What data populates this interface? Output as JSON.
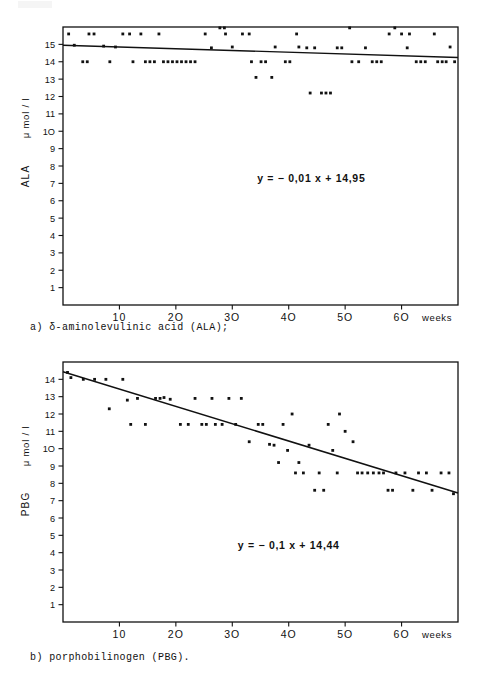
{
  "figure": {
    "kind": "two-panel-scatter-with-regression",
    "captions": {
      "a": "a) δ-aminolevulinic acid (ALA);",
      "b": "b) porphobilinogen (PBG)."
    }
  },
  "chart_data": [
    {
      "id": "panel-a",
      "type": "scatter",
      "title": "",
      "xlabel": "weeks",
      "ylabel": "ALA   μ mol / l",
      "ylabel_parts": {
        "analyte": "ALA",
        "unit": "μ mol / l"
      },
      "xlim": [
        0,
        70
      ],
      "ylim": [
        0,
        16
      ],
      "xticks": [
        10,
        20,
        30,
        40,
        50,
        60
      ],
      "xticklabels": [
        "10",
        "2O",
        "3O",
        "4O",
        "5O",
        "6O"
      ],
      "yticks": [
        1,
        2,
        3,
        4,
        5,
        6,
        7,
        8,
        9,
        10,
        11,
        12,
        13,
        14,
        15
      ],
      "yticklabels": [
        "1",
        "2",
        "3",
        "4",
        "5",
        "6",
        "7",
        "8",
        "9",
        "1O",
        "11",
        "12",
        "13",
        "14",
        "15"
      ],
      "grid": false,
      "frame": true,
      "annotation": "y = − 0,01 x + 14,95",
      "annotation_x": 44,
      "annotation_y": 7.1,
      "regression": {
        "slope": -0.01,
        "intercept": 14.95,
        "equation": "y = − 0,01 x + 14,95"
      },
      "points": [
        [
          1.0,
          15.6
        ],
        [
          2.0,
          14.95
        ],
        [
          3.5,
          14.0
        ],
        [
          4.3,
          14.0
        ],
        [
          4.6,
          15.6
        ],
        [
          5.5,
          15.6
        ],
        [
          7.2,
          14.9
        ],
        [
          8.3,
          14.0
        ],
        [
          9.3,
          14.85
        ],
        [
          10.6,
          15.6
        ],
        [
          11.8,
          15.6
        ],
        [
          12.4,
          14.0
        ],
        [
          13.8,
          15.6
        ],
        [
          14.6,
          14.0
        ],
        [
          15.4,
          14.0
        ],
        [
          16.2,
          14.0
        ],
        [
          17.0,
          15.6
        ],
        [
          17.8,
          14.0
        ],
        [
          18.6,
          14.0
        ],
        [
          19.4,
          14.0
        ],
        [
          20.2,
          14.0
        ],
        [
          21.0,
          14.0
        ],
        [
          21.8,
          14.0
        ],
        [
          22.6,
          14.0
        ],
        [
          23.4,
          14.0
        ],
        [
          25.2,
          15.6
        ],
        [
          26.3,
          14.8
        ],
        [
          27.8,
          15.95
        ],
        [
          28.6,
          15.95
        ],
        [
          28.8,
          15.6
        ],
        [
          30.0,
          14.85
        ],
        [
          31.8,
          15.6
        ],
        [
          33.0,
          15.6
        ],
        [
          33.4,
          14.0
        ],
        [
          34.2,
          13.1
        ],
        [
          35.1,
          14.0
        ],
        [
          35.9,
          14.0
        ],
        [
          37.0,
          13.1
        ],
        [
          37.6,
          14.85
        ],
        [
          39.4,
          14.0
        ],
        [
          40.2,
          14.0
        ],
        [
          41.4,
          15.6
        ],
        [
          41.8,
          14.85
        ],
        [
          43.2,
          14.8
        ],
        [
          43.8,
          12.2
        ],
        [
          44.6,
          14.8
        ],
        [
          45.8,
          12.2
        ],
        [
          46.6,
          12.2
        ],
        [
          47.4,
          12.2
        ],
        [
          48.6,
          14.8
        ],
        [
          49.4,
          14.8
        ],
        [
          50.8,
          15.95
        ],
        [
          51.2,
          14.0
        ],
        [
          52.4,
          14.0
        ],
        [
          53.6,
          14.8
        ],
        [
          54.8,
          14.0
        ],
        [
          55.6,
          14.0
        ],
        [
          56.4,
          14.0
        ],
        [
          57.8,
          15.6
        ],
        [
          58.8,
          15.95
        ],
        [
          60.0,
          15.6
        ],
        [
          61.0,
          14.8
        ],
        [
          61.4,
          15.6
        ],
        [
          62.6,
          14.0
        ],
        [
          63.4,
          14.0
        ],
        [
          64.2,
          14.0
        ],
        [
          65.8,
          15.6
        ],
        [
          66.4,
          14.0
        ],
        [
          67.2,
          14.0
        ],
        [
          67.9,
          14.0
        ],
        [
          68.6,
          14.85
        ],
        [
          69.4,
          14.0
        ]
      ]
    },
    {
      "id": "panel-b",
      "type": "scatter",
      "title": "",
      "xlabel": "weeks",
      "ylabel": "PBG   μ mol / l",
      "ylabel_parts": {
        "analyte": "PBG",
        "unit": "μ mol / l"
      },
      "xlim": [
        0,
        70
      ],
      "ylim": [
        0,
        15
      ],
      "xticks": [
        10,
        20,
        30,
        40,
        50,
        60
      ],
      "xticklabels": [
        "10",
        "2O",
        "3O",
        "4O",
        "5O",
        "6O"
      ],
      "yticks": [
        1,
        2,
        3,
        4,
        5,
        6,
        7,
        8,
        9,
        10,
        11,
        12,
        13,
        14
      ],
      "yticklabels": [
        "1",
        "2",
        "3",
        "4",
        "5",
        "6",
        "7",
        "8",
        "9",
        "1O",
        "11",
        "12",
        "13",
        "14"
      ],
      "grid": false,
      "frame": true,
      "annotation": "y = − 0,1 x + 14,44",
      "annotation_x": 40,
      "annotation_y": 4.2,
      "regression": {
        "slope": -0.1,
        "intercept": 14.44,
        "equation": "y = − 0,1 x + 14,44"
      },
      "points": [
        [
          0.8,
          14.4
        ],
        [
          1.4,
          14.1
        ],
        [
          3.6,
          14.0
        ],
        [
          5.6,
          14.0
        ],
        [
          7.6,
          14.0
        ],
        [
          8.2,
          12.3
        ],
        [
          10.6,
          14.0
        ],
        [
          11.4,
          12.8
        ],
        [
          12.0,
          11.4
        ],
        [
          13.2,
          12.9
        ],
        [
          14.6,
          11.4
        ],
        [
          16.4,
          12.9
        ],
        [
          17.2,
          12.9
        ],
        [
          17.9,
          12.95
        ],
        [
          19.0,
          12.85
        ],
        [
          20.8,
          11.4
        ],
        [
          22.2,
          11.4
        ],
        [
          23.4,
          12.9
        ],
        [
          24.6,
          11.4
        ],
        [
          25.4,
          11.4
        ],
        [
          26.4,
          12.9
        ],
        [
          27.0,
          11.4
        ],
        [
          28.2,
          11.4
        ],
        [
          29.4,
          12.9
        ],
        [
          30.6,
          11.4
        ],
        [
          31.6,
          12.9
        ],
        [
          33.0,
          10.4
        ],
        [
          34.6,
          11.4
        ],
        [
          35.4,
          11.4
        ],
        [
          36.6,
          10.25
        ],
        [
          37.4,
          10.2
        ],
        [
          38.2,
          9.2
        ],
        [
          39.0,
          11.4
        ],
        [
          39.8,
          9.9
        ],
        [
          40.6,
          12.0
        ],
        [
          41.2,
          8.6
        ],
        [
          41.8,
          9.2
        ],
        [
          42.6,
          8.6
        ],
        [
          43.6,
          10.2
        ],
        [
          44.6,
          7.6
        ],
        [
          45.4,
          8.6
        ],
        [
          46.2,
          7.6
        ],
        [
          47.0,
          11.4
        ],
        [
          47.8,
          9.9
        ],
        [
          48.6,
          8.6
        ],
        [
          49.0,
          12.0
        ],
        [
          50.0,
          11.0
        ],
        [
          51.4,
          10.4
        ],
        [
          52.2,
          8.6
        ],
        [
          53.0,
          8.6
        ],
        [
          54.0,
          8.6
        ],
        [
          55.0,
          8.6
        ],
        [
          56.0,
          8.6
        ],
        [
          56.8,
          8.6
        ],
        [
          57.6,
          7.6
        ],
        [
          58.4,
          7.6
        ],
        [
          59.0,
          8.6
        ],
        [
          60.6,
          8.6
        ],
        [
          62.0,
          7.6
        ],
        [
          63.0,
          8.6
        ],
        [
          64.4,
          8.6
        ],
        [
          65.4,
          7.6
        ],
        [
          67.0,
          8.6
        ],
        [
          68.4,
          8.6
        ],
        [
          69.2,
          7.4
        ]
      ]
    }
  ]
}
